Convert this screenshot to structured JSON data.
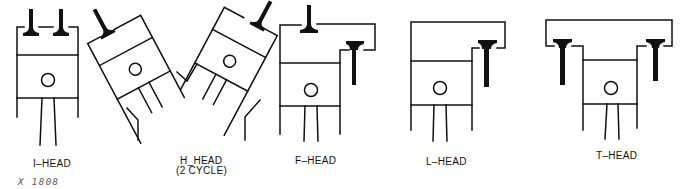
{
  "figure": {
    "reference": "X 1808",
    "colors": {
      "ink": "#111111",
      "background": "#ffffff",
      "reference_text": "#555555"
    },
    "diagrams": [
      {
        "id": "i-head",
        "label": "I–HEAD",
        "valves": 2,
        "valve_location": "in head, overhead"
      },
      {
        "id": "h-head",
        "label": "H_HEAD",
        "sublabel": "(2 CYCLE)",
        "valves": 2,
        "valve_location": "in heads of opposed tilted cylinders"
      },
      {
        "id": "f-head",
        "label": "F–HEAD",
        "valves": 2,
        "valve_location": "one overhead, one in block"
      },
      {
        "id": "l-head",
        "label": "L–HEAD",
        "valves": 1,
        "valve_location": "in block beside cylinder"
      },
      {
        "id": "t-head",
        "label": "T–HEAD",
        "valves": 2,
        "valve_location": "in block on both sides of cylinder"
      }
    ]
  }
}
